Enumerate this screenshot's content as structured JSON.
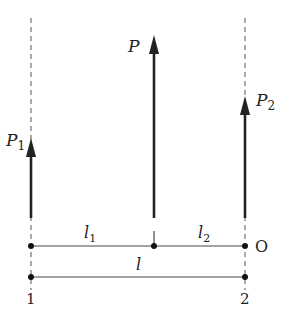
{
  "diagram": {
    "type": "force-diagram",
    "forces": [
      {
        "id": "P1",
        "label": "P",
        "subscript": "1",
        "direction": "up",
        "x": 31
      },
      {
        "id": "P",
        "label": "P",
        "subscript": "",
        "direction": "up",
        "x": 154
      },
      {
        "id": "P2",
        "label": "P",
        "subscript": "2",
        "direction": "up",
        "x": 245
      }
    ],
    "dimensions": [
      {
        "label": "l",
        "subscript": "1",
        "from": "1",
        "to": "P"
      },
      {
        "label": "l",
        "subscript": "2",
        "from": "P",
        "to": "O"
      },
      {
        "label": "l",
        "subscript": "",
        "from": "1",
        "to": "2"
      }
    ],
    "points": [
      {
        "label": "O"
      },
      {
        "label": "1"
      },
      {
        "label": "2"
      }
    ],
    "colors": {
      "stroke": "#222222",
      "dashed": "#555555",
      "background": "#ffffff"
    }
  }
}
